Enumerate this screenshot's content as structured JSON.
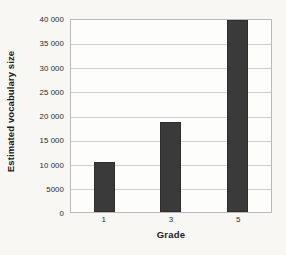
{
  "chart_data": {
    "type": "bar",
    "title": "",
    "subtitle": "",
    "categories": [
      "1",
      "3",
      "5"
    ],
    "values": [
      10500,
      18700,
      40000
    ],
    "series": [
      {
        "name": "Estimated vocabulary size",
        "values": [
          10500,
          18700,
          40000
        ]
      }
    ],
    "xlabel": "Grade",
    "ylabel": "Estimated vocabulary size",
    "ylim": [
      0,
      40000
    ],
    "y_ticks": [
      0,
      5000,
      10000,
      15000,
      20000,
      25000,
      30000,
      35000,
      40000
    ],
    "y_tick_labels": [
      "0",
      "5000",
      "10 000",
      "15 000",
      "20 000",
      "25 000",
      "30 000",
      "35 000",
      "40 000"
    ],
    "x_tick_labels": [
      "1",
      "3",
      "5"
    ],
    "grid": true,
    "grid_axis": "y",
    "legend": false,
    "legend_position": "none",
    "bar_color": "#3a3a3a",
    "grid_color": "#cfcfcf",
    "axis_color": "#b9b9b9",
    "background_color": "#f8f7f4",
    "plot_background_color": "#fdfdfc"
  }
}
